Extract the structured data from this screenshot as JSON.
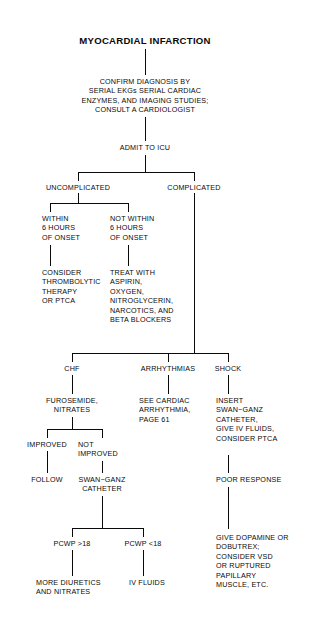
{
  "diagram": {
    "type": "flowchart",
    "title": "MYOCARDIAL INFARCTION",
    "nodes": {
      "title": "MYOCARDIAL INFARCTION",
      "confirm": "CONFIRM DIAGNOSIS BY\nSERIAL EKGs SERIAL CARDIAC\nENZYMES, AND IMAGING STUDIES;\nCONSULT A CARDIOLOGIST",
      "admit": "ADMIT TO ICU",
      "uncomplicated": "UNCOMPLICATED",
      "complicated": "COMPLICATED",
      "within_6": "WITHIN\n6 HOURS\nOF ONSET",
      "not_within_6": "NOT WITHIN\n6 HOURS\nOF ONSET",
      "consider_thrombolytic": "CONSIDER\nTHROMBOLYTIC\nTHERAPY\nOR PTCA",
      "treat_with": "TREAT WITH\nASPIRIN,\nOXYGEN,\nNITROGLYCERIN,\nNARCOTICS, AND\nBETA BLOCKERS",
      "chf": "CHF",
      "arrhythmias": "ARRHYTHMIAS",
      "shock": "SHOCK",
      "furosemide": "FUROSEMIDE,\nNITRATES",
      "see_cardiac": "SEE CARDIAC\nARRHYTHMIA,\nPAGE 61",
      "insert_swan": "INSERT\nSWAN−GANZ\nCATHETER,\nGIVE IV FLUIDS,\nCONSIDER PTCA",
      "improved": "IMPROVED",
      "not_improved": "NOT\nIMPROVED",
      "follow": "FOLLOW",
      "swan_ganz_catheter": "SWAN−GANZ\nCATHETER",
      "poor_response": "POOR RESPONSE",
      "give_dopamine": "GIVE DOPAMINE OR\nDOBUTREX;\nCONSIDER VSD\nOR RUPTURED\nPAPILLARY\nMUSCLE, ETC.",
      "pcwp_high": "PCWP >18",
      "pcwp_low": "PCWP <18",
      "more_diuretics": "MORE DIURETICS\nAND NITRATES",
      "iv_fluids": "IV FLUIDS"
    }
  }
}
